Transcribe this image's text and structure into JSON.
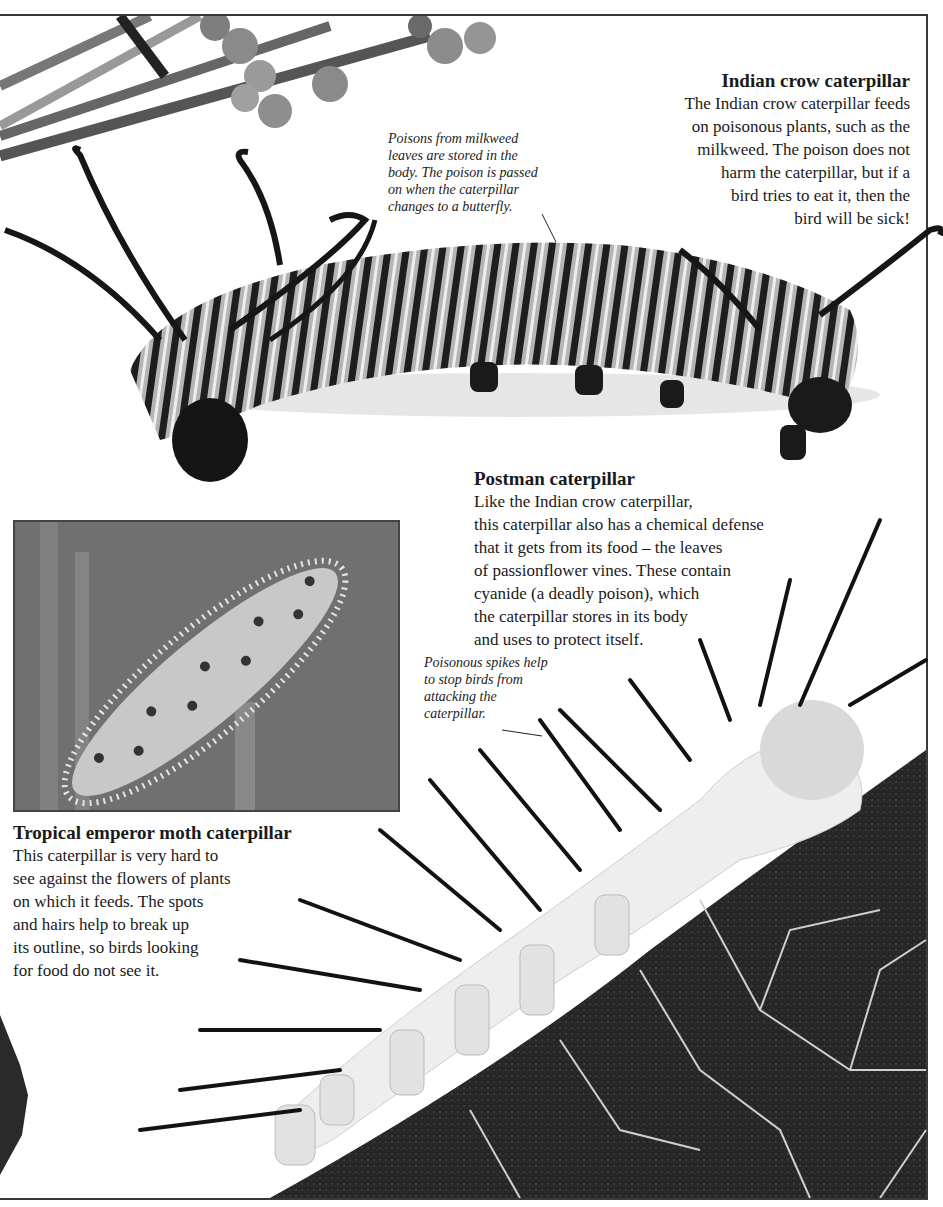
{
  "page": {
    "style": "grayscale scanned book page",
    "colors": {
      "text": "#1a1a1a",
      "frame": "#3a3a3a",
      "background": "#ffffff"
    }
  },
  "sections": {
    "indian_crow": {
      "heading": "Indian crow caterpillar",
      "body": "The Indian crow caterpillar feeds\non poisonous plants, such as the\nmilkweed. The poison does not\nharm the caterpillar, but if a\nbird tries to eat it, then the\nbird will be sick!",
      "caption": "Poisons from milkweed\nleaves are stored in the\nbody. The poison is passed\non when the caterpillar\nchanges to a butterfly."
    },
    "postman": {
      "heading": "Postman caterpillar",
      "body": "Like the Indian crow caterpillar,\nthis caterpillar also has a chemical defense\nthat it gets from its food – the leaves\nof passionflower vines. These contain\ncyanide (a deadly poison), which\nthe caterpillar stores in its body\nand uses to protect itself.",
      "caption": "Poisonous spikes help\nto stop birds from\nattacking the\ncaterpillar."
    },
    "tropical_emperor": {
      "heading": "Tropical emperor moth caterpillar",
      "body": "This caterpillar is very hard to\nsee against the flowers of plants\non which it feeds. The spots\nand hairs help to break up\nits outline, so birds looking\nfor food do not see it."
    }
  },
  "images": {
    "milkweed": "milkweed-plant-photo",
    "indian_crow": "indian-crow-caterpillar-photo",
    "tropical_emperor": "tropical-emperor-moth-caterpillar-photo",
    "postman": "postman-caterpillar-on-leaf-photo"
  }
}
